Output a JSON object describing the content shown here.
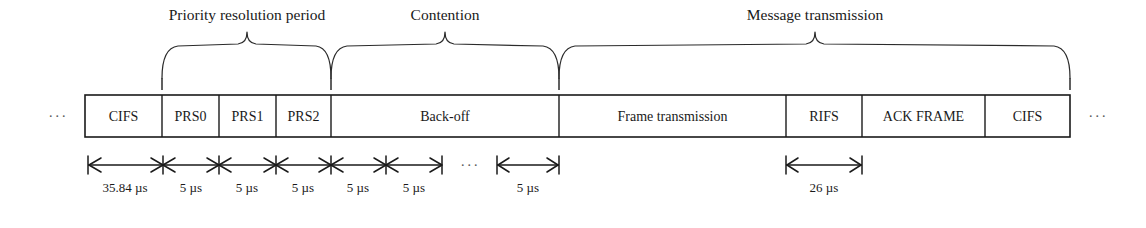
{
  "diagram": {
    "leading_ellipsis": "···",
    "trailing_ellipsis": "···",
    "midline_ellipsis": "···",
    "colors": {
      "stroke": "#1a1a1a",
      "brace": "#2b2b2b",
      "background": "#ffffff",
      "ellipsis": "#5a5a5a"
    }
  },
  "timeline": {
    "cells": [
      {
        "id": "cifs-1",
        "label": "CIFS",
        "x0": 85,
        "x1": 162
      },
      {
        "id": "prs0",
        "label": "PRS0",
        "x0": 162,
        "x1": 219
      },
      {
        "id": "prs1",
        "label": "PRS1",
        "x0": 219,
        "x1": 276
      },
      {
        "id": "prs2",
        "label": "PRS2",
        "x0": 276,
        "x1": 331
      },
      {
        "id": "back-off",
        "label": "Back-off",
        "x0": 331,
        "x1": 559
      },
      {
        "id": "frame-transmission",
        "label": "Frame transmission",
        "x0": 559,
        "x1": 786
      },
      {
        "id": "rifs",
        "label": "RIFS",
        "x0": 786,
        "x1": 862
      },
      {
        "id": "ack-frame",
        "label": "ACK FRAME",
        "x0": 862,
        "x1": 985
      },
      {
        "id": "cifs-2",
        "label": "CIFS",
        "x0": 985,
        "x1": 1070
      }
    ],
    "bar_top": 95,
    "bar_bottom": 137
  },
  "braces": [
    {
      "id": "priority-resolution-period",
      "label": "Priority resolution period",
      "x0": 162,
      "x1": 331,
      "label_x": 247,
      "label_y": 20
    },
    {
      "id": "contention",
      "label": "Contention",
      "x0": 331,
      "x1": 559,
      "label_x": 445,
      "label_y": 20
    },
    {
      "id": "message-transmission",
      "label": "Message transmission",
      "x0": 559,
      "x1": 1070,
      "label_x": 815,
      "label_y": 20
    }
  ],
  "dimensions": {
    "chain": {
      "id": "priority-chain",
      "y": 165,
      "label_y": 190,
      "segments": [
        {
          "id": "cifs-duration",
          "label": "35.84 µs",
          "x0": 88,
          "x1": 163
        },
        {
          "id": "prs0-duration",
          "label": "5 µs",
          "x0": 163,
          "x1": 219
        },
        {
          "id": "prs1-duration",
          "label": "5 µs",
          "x0": 219,
          "x1": 276
        },
        {
          "id": "prs2-duration",
          "label": "5 µs",
          "x0": 276,
          "x1": 331
        },
        {
          "id": "slot1-duration",
          "label": "5 µs",
          "x0": 331,
          "x1": 386
        },
        {
          "id": "slot2-duration",
          "label": "5 µs",
          "x0": 386,
          "x1": 442
        }
      ]
    },
    "gap_ellipsis": {
      "id": "slot-gap-ellipsis",
      "x": 470,
      "y": 165
    },
    "standalone": [
      {
        "id": "last-slot-duration",
        "label": "5 µs",
        "x0": 497,
        "x1": 559,
        "y": 165,
        "label_y": 190
      },
      {
        "id": "rifs-duration",
        "label": "26 µs",
        "x0": 786,
        "x1": 862,
        "y": 165,
        "label_y": 190
      }
    ]
  },
  "edge_marks": {
    "left_ellipsis": {
      "x": 58,
      "y": 121
    },
    "right_ellipsis": {
      "x": 1098,
      "y": 121
    }
  }
}
